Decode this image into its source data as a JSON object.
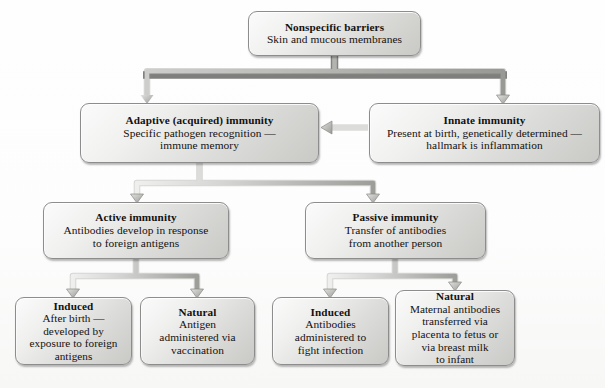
{
  "diagram": {
    "colors": {
      "box_fill_light": "#fbfbfb",
      "box_fill_dark": "#c9c9c6",
      "box_border": "#8d8d8d",
      "connector": "#9a9a98",
      "text": "#14110f",
      "background": "#ffffff"
    },
    "nodes": [
      {
        "id": "nonspecific",
        "title": "Nonspecific barriers",
        "body": "Skin and mucous membranes"
      },
      {
        "id": "adaptive",
        "title": "Adaptive (acquired) immunity",
        "body": "Specific pathogen recognition —\nimmune memory"
      },
      {
        "id": "innate",
        "title": "Innate immunity",
        "body": "Present at birth, genetically determined —\nhallmark is inflammation"
      },
      {
        "id": "active",
        "title": "Active immunity",
        "body": "Antibodies develop in response\nto foreign antigens"
      },
      {
        "id": "passive",
        "title": "Passive immunity",
        "body": "Transfer of antibodies\nfrom another person"
      },
      {
        "id": "induced_active",
        "title": "Induced",
        "body": "After birth —\ndeveloped by\nexposure to foreign\nantigens"
      },
      {
        "id": "natural_active",
        "title": "Natural",
        "body": "Antigen\nadministered via\nvaccination"
      },
      {
        "id": "induced_passive",
        "title": "Induced",
        "body": "Antibodies\nadministered to\nfight infection"
      },
      {
        "id": "natural_passive",
        "title": "Natural",
        "body": "Maternal antibodies\ntransferred via\nplacenta to fetus or\nvia breast milk\nto infant"
      }
    ],
    "edges": [
      {
        "from": "nonspecific",
        "to": "adaptive",
        "style": "elbow-down-left-arrow"
      },
      {
        "from": "nonspecific",
        "to": "innate",
        "style": "elbow-down-right-arrow"
      },
      {
        "from": "innate",
        "to": "adaptive",
        "style": "horizontal-left-arrow"
      },
      {
        "from": "adaptive",
        "to": "active",
        "style": "elbow-down-left-arrow"
      },
      {
        "from": "adaptive",
        "to": "passive",
        "style": "elbow-down-right-arrow"
      },
      {
        "from": "active",
        "to": "induced_active",
        "style": "elbow-down-left-arrow"
      },
      {
        "from": "active",
        "to": "natural_active",
        "style": "elbow-down-right-arrow"
      },
      {
        "from": "passive",
        "to": "induced_passive",
        "style": "elbow-down-left-arrow"
      },
      {
        "from": "passive",
        "to": "natural_passive",
        "style": "elbow-down-right-arrow"
      }
    ],
    "caption": ""
  }
}
